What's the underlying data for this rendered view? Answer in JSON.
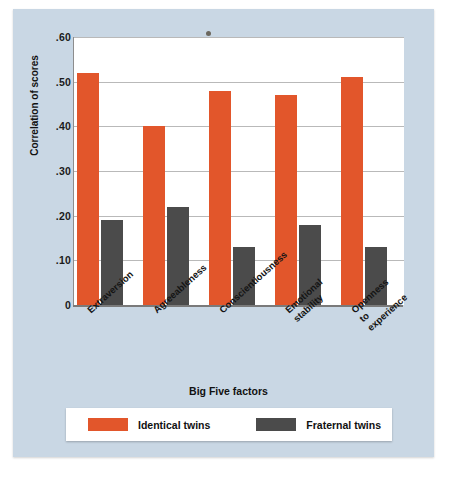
{
  "figure": {
    "background_color": "#c9d7e4",
    "panel_color": "#ffffff"
  },
  "chart_data": {
    "type": "bar",
    "title": "",
    "xlabel": "Big Five factors",
    "ylabel": "Correlation of scores",
    "ylim": [
      0,
      0.6
    ],
    "grid": true,
    "legend_position": "bottom",
    "categories": [
      "Extraversion",
      "Agreeableness",
      "Conscientiousness",
      "Emotional\nstability",
      "Openness\nto\nexperience"
    ],
    "ytick_labels": [
      ".60",
      ".50",
      ".40",
      ".30",
      ".20",
      ".10",
      "0"
    ],
    "ytick_values": [
      0.6,
      0.5,
      0.4,
      0.3,
      0.2,
      0.1,
      0
    ],
    "series": [
      {
        "name": "Identical twins",
        "color": "#e2562b",
        "values": [
          0.52,
          0.4,
          0.48,
          0.47,
          0.51
        ]
      },
      {
        "name": "Fraternal twins",
        "color": "#4b4b4b",
        "values": [
          0.19,
          0.22,
          0.13,
          0.18,
          0.13
        ]
      }
    ]
  },
  "legend": {
    "entries": [
      {
        "label": "Identical twins",
        "color": "#e2562b"
      },
      {
        "label": "Fraternal twins",
        "color": "#4b4b4b"
      }
    ]
  }
}
